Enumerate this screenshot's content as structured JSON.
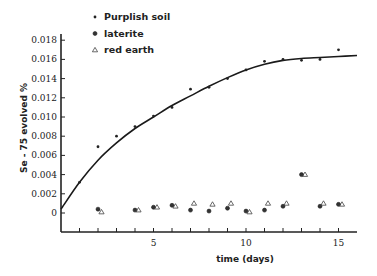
{
  "chart_data": {
    "type": "scatter",
    "title": "",
    "xlabel": "time (days)",
    "ylabel": "Se - 75 evolved %",
    "xlim": [
      0,
      16
    ],
    "ylim": [
      0,
      0.018
    ],
    "x_ticks": [
      1,
      2,
      3,
      4,
      5,
      6,
      7,
      8,
      9,
      10,
      11,
      12,
      13,
      14,
      15
    ],
    "x_tick_labels": [
      "5",
      "10",
      "15"
    ],
    "y_ticks": [
      0,
      0.002,
      0.004,
      0.006,
      0.008,
      0.01,
      0.012,
      0.014,
      0.016,
      0.018
    ],
    "y_tick_labels": [
      "0",
      "0.002",
      "0.004",
      "0.006",
      "0.008",
      "0.010",
      "0.012",
      "0.014",
      "0.016",
      "0.018"
    ],
    "grid": false,
    "legend_position": "top-left inside",
    "series": [
      {
        "name": "Purplish soil",
        "marker": "small dot",
        "x": [
          1,
          2,
          3,
          4,
          5,
          6,
          7,
          8,
          9,
          10,
          11,
          12,
          13,
          14,
          15
        ],
        "values": [
          0.0032,
          0.0069,
          0.008,
          0.009,
          0.0101,
          0.011,
          0.0129,
          0.0131,
          0.014,
          0.0149,
          0.0158,
          0.016,
          0.0159,
          0.016,
          0.017
        ],
        "fit_curve": {
          "x": [
            0,
            1,
            2,
            3,
            4,
            5,
            6,
            7,
            8,
            9,
            10,
            11,
            12,
            13,
            14,
            15,
            16
          ],
          "values": [
            0.0004,
            0.0032,
            0.0055,
            0.0073,
            0.0088,
            0.01,
            0.0112,
            0.0122,
            0.0132,
            0.0141,
            0.0149,
            0.0155,
            0.0159,
            0.0161,
            0.0162,
            0.0163,
            0.0164
          ]
        }
      },
      {
        "name": "laterite",
        "marker": "filled dot",
        "x": [
          2,
          4,
          5,
          6,
          7,
          8,
          9,
          10,
          11,
          12,
          13,
          14,
          15
        ],
        "values": [
          0.0004,
          0.0003,
          0.0006,
          0.0008,
          0.0003,
          0.0002,
          0.0005,
          0.0002,
          0.0003,
          0.0007,
          0.004,
          0.0007,
          0.0009
        ]
      },
      {
        "name": "red earth",
        "marker": "open triangle",
        "x": [
          2,
          4,
          5,
          6,
          7,
          8,
          9,
          10,
          11,
          12,
          13,
          14,
          15
        ],
        "values": [
          0.0001,
          0.0003,
          0.0006,
          0.0007,
          0.001,
          0.0009,
          0.001,
          0.0001,
          0.001,
          0.001,
          0.004,
          0.001,
          0.0009
        ]
      }
    ]
  },
  "legend": {
    "items": [
      {
        "label": "Purplish soil",
        "marker": "small dot"
      },
      {
        "label": "laterite",
        "marker": "filled dot"
      },
      {
        "label": "red earth",
        "marker": "open triangle"
      }
    ]
  },
  "axes": {
    "xlabel": "time (days)",
    "ylabel": "Se - 75 evolved %"
  }
}
